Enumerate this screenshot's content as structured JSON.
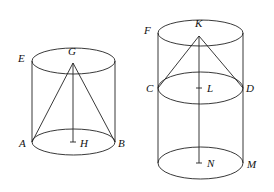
{
  "diagram": {
    "figures": [
      {
        "name": "left-cylinder",
        "labels": {
          "E": "E",
          "G": "G",
          "A": "A",
          "H": "H",
          "B": "B"
        }
      },
      {
        "name": "right-cylinder",
        "labels": {
          "F": "F",
          "K": "K",
          "C": "C",
          "L": "L",
          "D": "D",
          "N": "N",
          "M": "M"
        }
      }
    ],
    "colors": {
      "stroke": "#222222",
      "background": "#ffffff"
    }
  }
}
